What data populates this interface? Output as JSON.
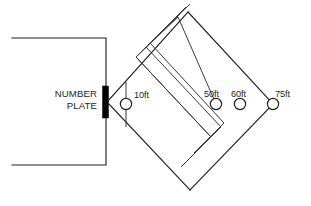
{
  "diagram": {
    "plate": {
      "label_line1": "NUMBER",
      "label_line2": "PLATE",
      "bar_color": "#000000"
    },
    "line_color": "#231f20",
    "background_color": "#ffffff",
    "markers": [
      {
        "id": "marker-10ft",
        "label": "10ft",
        "cx": 126,
        "cy": 104,
        "r": 5.6,
        "label_x": 134,
        "label_y": 98
      },
      {
        "id": "marker-50ft",
        "label": "50ft",
        "cx": 216,
        "cy": 104,
        "r": 5.6,
        "label_x": 205,
        "label_y": 97
      },
      {
        "id": "marker-60ft",
        "label": "60ft",
        "cx": 240,
        "cy": 104,
        "r": 5.6,
        "label_x": 232,
        "label_y": 97
      },
      {
        "id": "marker-75ft",
        "label": "75ft",
        "cx": 273,
        "cy": 104,
        "r": 5.6,
        "label_x": 274,
        "label_y": 97
      }
    ],
    "diamond": {
      "top": [
        188,
        12
      ],
      "left": [
        110,
        100
      ],
      "bottom": [
        190,
        190
      ],
      "right": [
        273,
        104
      ]
    },
    "enclosure": {
      "top_y": 38,
      "bottom_y": 165,
      "right_x": 106,
      "left_x": 12
    }
  }
}
